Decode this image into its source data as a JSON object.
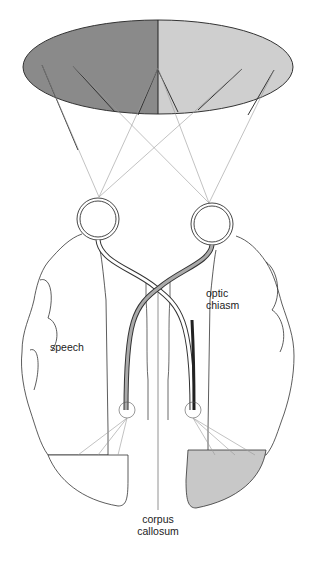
{
  "figure": {
    "visual_field": {
      "left_half_color": "#8a8a8a",
      "right_half_color": "#cfcfcf"
    },
    "shaded_region_color": "#c8c8c8",
    "labels": {
      "optic_chiasm_line1": "optic",
      "optic_chiasm_line2": "chiasm",
      "speech": "speech",
      "corpus_line1": "corpus",
      "corpus_line2": "callosum"
    }
  }
}
